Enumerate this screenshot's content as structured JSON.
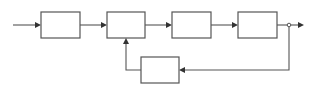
{
  "diagram": {
    "type": "block-diagram-feedback-loop",
    "colors": {
      "line": "#555555",
      "arrowhead": "#333333",
      "background": "#ffffff"
    },
    "blocks": [
      {
        "id": "block-1",
        "label": "",
        "x": 41,
        "y": 12,
        "w": 39,
        "h": 26
      },
      {
        "id": "block-2",
        "label": "",
        "x": 107,
        "y": 12,
        "w": 38,
        "h": 26
      },
      {
        "id": "block-3",
        "label": "",
        "x": 172,
        "y": 12,
        "w": 39,
        "h": 26
      },
      {
        "id": "block-4",
        "label": "",
        "x": 238,
        "y": 12,
        "w": 39,
        "h": 26
      },
      {
        "id": "feedback-block",
        "label": "",
        "x": 141,
        "y": 57,
        "w": 38,
        "h": 26
      }
    ],
    "connections": [
      {
        "from": "input",
        "to": "block-1"
      },
      {
        "from": "block-1",
        "to": "block-2"
      },
      {
        "from": "block-2",
        "to": "block-3"
      },
      {
        "from": "block-3",
        "to": "block-4"
      },
      {
        "from": "block-4",
        "to": "output"
      },
      {
        "from": "branch-point",
        "to": "feedback-block"
      },
      {
        "from": "feedback-block",
        "to": "block-2"
      }
    ]
  }
}
